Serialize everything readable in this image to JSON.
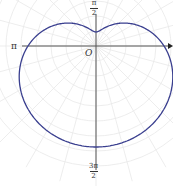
{
  "chart_data": {
    "type": "line",
    "subtype": "polar",
    "title": "",
    "curve": "limacon (dimpled) r = a - b·sin(θ)",
    "origin_label": "O",
    "angle_labels": {
      "pi_over_2": {
        "num": "π",
        "den": "2"
      },
      "pi": "π",
      "three_pi_over_2": {
        "num": "3π",
        "den": "2"
      }
    },
    "grid": true,
    "colors": {
      "curve": "#3a3f8f",
      "axis": "#555555",
      "grid": "#e6e6e6"
    },
    "approx_radii_px": {
      "theta_0": 68,
      "theta_pi_2": 14,
      "theta_pi": 68,
      "theta_3pi_2": 101
    }
  }
}
